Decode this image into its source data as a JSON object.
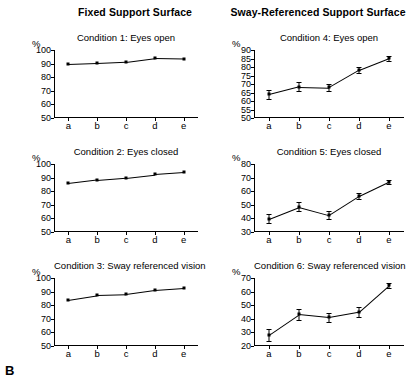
{
  "panel_label": "B",
  "columns": [
    {
      "id": "fixed",
      "header": "Fixed Support Surface"
    },
    {
      "id": "sway",
      "header": "Sway-Referenced Support Surface"
    }
  ],
  "axis_unit_label": "%",
  "x_categories": [
    "a",
    "b",
    "c",
    "d",
    "e"
  ],
  "chart_data": [
    {
      "type": "line",
      "id": "condition-1",
      "title": "Condition 1: Eyes open",
      "column": "Fixed Support Surface",
      "categories": [
        "a",
        "b",
        "c",
        "d",
        "e"
      ],
      "values": [
        89.5,
        90.2,
        91.2,
        94.0,
        93.6
      ],
      "errors": [
        0,
        0,
        0,
        0,
        0
      ],
      "xlabel": "",
      "ylabel": "%",
      "ylim": [
        50,
        100
      ],
      "yticks": [
        50,
        60,
        70,
        80,
        90,
        100
      ],
      "grid": false,
      "legend": "none"
    },
    {
      "type": "line",
      "id": "condition-4",
      "title": "Condition 4: Eyes open",
      "column": "Sway-Referenced Support Surface",
      "categories": [
        "a",
        "b",
        "c",
        "d",
        "e"
      ],
      "values": [
        64.0,
        68.5,
        68.0,
        78.2,
        85.2
      ],
      "errors": [
        2.6,
        2.4,
        2.0,
        1.6,
        1.4
      ],
      "xlabel": "",
      "ylabel": "%",
      "ylim": [
        50,
        90
      ],
      "yticks": [
        50,
        55,
        60,
        65,
        70,
        75,
        80,
        85,
        90
      ],
      "grid": false,
      "legend": "none"
    },
    {
      "type": "line",
      "id": "condition-2",
      "title": "Condition 2: Eyes closed",
      "column": "Fixed Support Surface",
      "categories": [
        "a",
        "b",
        "c",
        "d",
        "e"
      ],
      "values": [
        85.8,
        88.4,
        90.0,
        92.4,
        93.8
      ],
      "errors": [
        0,
        0,
        0,
        0,
        0
      ],
      "xlabel": "",
      "ylabel": "%",
      "ylim": [
        50,
        100
      ],
      "yticks": [
        50,
        60,
        70,
        80,
        90,
        100
      ],
      "grid": false,
      "legend": "none"
    },
    {
      "type": "line",
      "id": "condition-5",
      "title": "Condition 5: Eyes closed",
      "column": "Sway-Referenced Support Surface",
      "categories": [
        "a",
        "b",
        "c",
        "d",
        "e"
      ],
      "values": [
        39.8,
        48.5,
        42.5,
        56.5,
        67.0
      ],
      "errors": [
        3.2,
        3.4,
        2.6,
        2.2,
        1.6
      ],
      "xlabel": "",
      "ylabel": "%",
      "ylim": [
        30,
        80
      ],
      "yticks": [
        30,
        40,
        50,
        60,
        70,
        80
      ],
      "grid": false,
      "legend": "none"
    },
    {
      "type": "line",
      "id": "condition-3",
      "title": "Condition 3: Sway referenced vision",
      "column": "Fixed Support Surface",
      "categories": [
        "a",
        "b",
        "c",
        "d",
        "e"
      ],
      "values": [
        84.0,
        87.4,
        88.0,
        91.0,
        92.4
      ],
      "errors": [
        0,
        0,
        0,
        0,
        0
      ],
      "xlabel": "",
      "ylabel": "%",
      "ylim": [
        50,
        100
      ],
      "yticks": [
        50,
        60,
        70,
        80,
        90,
        100
      ],
      "grid": false,
      "legend": "none"
    },
    {
      "type": "line",
      "id": "condition-6",
      "title": "Condition 6: Sway referenced vision",
      "column": "Sway-Referenced Support Surface",
      "categories": [
        "a",
        "b",
        "c",
        "d",
        "e"
      ],
      "values": [
        28.2,
        43.2,
        41.0,
        45.0,
        64.5
      ],
      "errors": [
        4.2,
        4.0,
        3.2,
        3.4,
        2.0
      ],
      "xlabel": "",
      "ylabel": "%",
      "ylim": [
        20,
        70
      ],
      "yticks": [
        20,
        30,
        40,
        50,
        60,
        70
      ],
      "grid": false,
      "legend": "none"
    }
  ]
}
